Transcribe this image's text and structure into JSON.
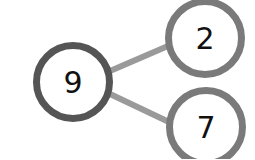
{
  "diagram": {
    "type": "number-bond",
    "whole": {
      "value": "9"
    },
    "parts": [
      {
        "value": "2"
      },
      {
        "value": "7"
      }
    ],
    "colors": {
      "whole_stroke": "#555555",
      "part_stroke": "#7a7a7a",
      "connector": "#9a9a9a",
      "text": "#111111",
      "background": "#ffffff"
    }
  }
}
